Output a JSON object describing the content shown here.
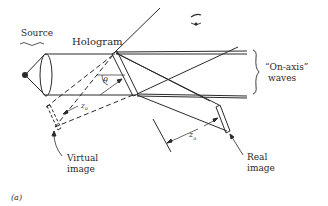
{
  "labels": {
    "source": "Source",
    "hologram": "Hologram",
    "theta": "θ",
    "on_axis_line1": "“On-axis”",
    "on_axis_line2": "waves",
    "z0_virtual": "z",
    "z0_virtual_sub": "o",
    "z0_real": "z",
    "z0_real_sub": "o",
    "virtual_line1": "Virtual",
    "virtual_line2": "image",
    "real_line1": "Real",
    "real_line2": "image",
    "panel": "(a)"
  },
  "colors": {
    "ink": "#2a2a2a",
    "background": "#ffffff"
  }
}
